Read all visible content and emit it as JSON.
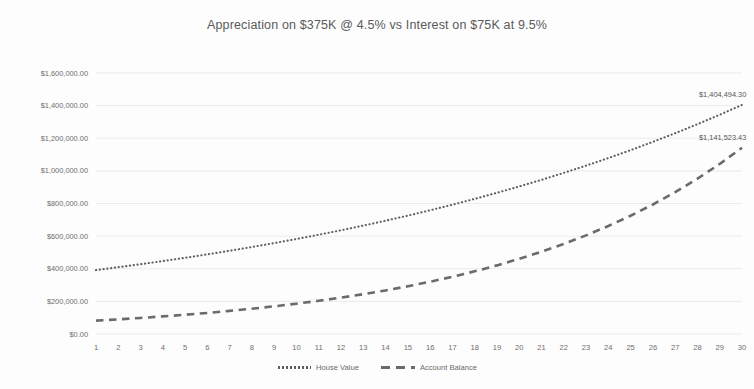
{
  "chart_data": {
    "type": "line",
    "title": "Appreciation on $375K @ 4.5% vs Interest on $75K at 9.5%",
    "xlabel": "",
    "ylabel": "",
    "grid": true,
    "legend_position": "bottom",
    "ylim": [
      0,
      1600000
    ],
    "ytick_labels": [
      "$1,600,000.00",
      "$1,400,000.00",
      "$1,200,000.00",
      "$1,000,000.00",
      "$800,000.00",
      "$600,000.00",
      "$400,000.00",
      "$200,000.00",
      "$0.00"
    ],
    "ytick_values": [
      1600000,
      1400000,
      1200000,
      1000000,
      800000,
      600000,
      400000,
      200000,
      0
    ],
    "categories": [
      1,
      2,
      3,
      4,
      5,
      6,
      7,
      8,
      9,
      10,
      11,
      12,
      13,
      14,
      15,
      16,
      17,
      18,
      19,
      20,
      21,
      22,
      23,
      24,
      25,
      26,
      27,
      28,
      29,
      30
    ],
    "series": [
      {
        "name": "House Value",
        "style": "dotted",
        "color": "#5f5f5f",
        "values": [
          391875,
          409509,
          427937,
          447194,
          467318,
          488347,
          510322,
          533286,
          557284,
          582362,
          608568,
          635954,
          664572,
          694478,
          725730,
          758388,
          792515,
          828178,
          865446,
          904391,
          945089,
          987618,
          1032061,
          1078504,
          1127037,
          1177754,
          1230753,
          1286137,
          1344013,
          1404494
        ],
        "end_label": "$1,404,494.30"
      },
      {
        "name": "Account Balance",
        "style": "dashed",
        "color": "#6b6b6b",
        "values": [
          82125,
          89927,
          98470,
          107825,
          118068,
          129285,
          141567,
          155016,
          169742,
          185868,
          203525,
          222860,
          244032,
          267215,
          292600,
          320397,
          350835,
          384164,
          420660,
          460622,
          504381,
          552297,
          604765,
          662218,
          725129,
          794016,
          869447,
          952045,
          1042489,
          1141523
        ],
        "end_label": "$1,141,523.43"
      }
    ]
  },
  "legend": {
    "items": [
      {
        "label": "House Value"
      },
      {
        "label": "Account Balance"
      }
    ]
  }
}
